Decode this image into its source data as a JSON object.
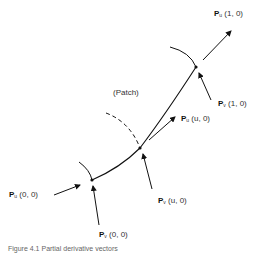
{
  "labels": {
    "pu_10": {
      "vec": "P",
      "sub": "u",
      "args": "(1, 0)"
    },
    "pv_10": {
      "vec": "P",
      "sub": "v",
      "args": "(1, 0)"
    },
    "patch": "(Patch)",
    "pu_u0": {
      "vec": "P",
      "sub": "u",
      "args": "(u, 0)"
    },
    "pv_u0": {
      "vec": "P",
      "sub": "v",
      "args": "(u, 0)"
    },
    "pu_00": {
      "vec": "P",
      "sub": "u",
      "args": "(0, 0)"
    },
    "pv_00": {
      "vec": "P",
      "sub": "v",
      "args": "(0, 0)"
    }
  },
  "caption": "Figure 4.1  Partial derivative vectors"
}
